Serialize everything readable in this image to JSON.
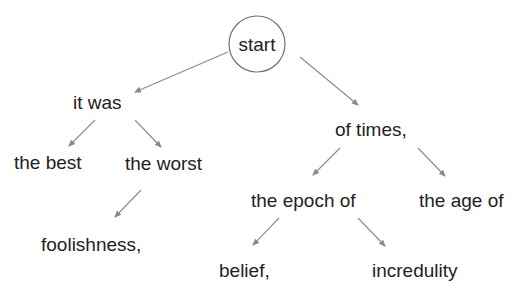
{
  "diagram": {
    "type": "tree",
    "colors": {
      "text": "#222222",
      "edge": "#8a8a8a",
      "circle": "#6e6e6e"
    },
    "nodes": [
      {
        "id": "start",
        "label": "start",
        "shape": "circle"
      },
      {
        "id": "it_was",
        "label": "it was"
      },
      {
        "id": "the_best",
        "label": "the best"
      },
      {
        "id": "the_worst",
        "label": "the worst"
      },
      {
        "id": "foolishness",
        "label": "foolishness,"
      },
      {
        "id": "of_times",
        "label": "of times,"
      },
      {
        "id": "the_epoch_of",
        "label": "the epoch of"
      },
      {
        "id": "the_age_of",
        "label": "the age of"
      },
      {
        "id": "belief",
        "label": "belief,"
      },
      {
        "id": "incredulity",
        "label": "incredulity"
      }
    ],
    "edges": [
      {
        "from": "start",
        "to": "it_was"
      },
      {
        "from": "start",
        "to": "of_times"
      },
      {
        "from": "it_was",
        "to": "the_best"
      },
      {
        "from": "it_was",
        "to": "the_worst"
      },
      {
        "from": "the_worst",
        "to": "foolishness"
      },
      {
        "from": "of_times",
        "to": "the_epoch_of"
      },
      {
        "from": "of_times",
        "to": "the_age_of"
      },
      {
        "from": "the_epoch_of",
        "to": "belief"
      },
      {
        "from": "the_epoch_of",
        "to": "incredulity"
      }
    ]
  }
}
